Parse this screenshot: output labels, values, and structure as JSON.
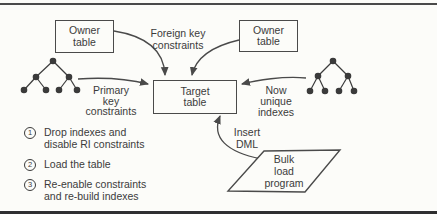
{
  "colors": {
    "background": "#fcfcf9",
    "line": "#4a4a4a",
    "text": "#3b3b3b"
  },
  "nodes": {
    "owner_table_left": {
      "lines": [
        "Owner",
        "table"
      ]
    },
    "owner_table_right": {
      "lines": [
        "Owner",
        "table"
      ]
    },
    "target_table": {
      "lines": [
        "Target",
        "table"
      ]
    },
    "bulk_load_program": {
      "lines": [
        "Bulk",
        "load",
        "program"
      ]
    }
  },
  "edge_labels": {
    "foreign_key": {
      "lines": [
        "Foreign key",
        "constraints"
      ]
    },
    "primary_key": {
      "lines": [
        "Primary",
        "key",
        "constraints"
      ]
    },
    "now_unique": {
      "lines": [
        "Now",
        "unique",
        "indexes"
      ]
    },
    "insert_dml": {
      "lines": [
        "Insert",
        "DML"
      ]
    }
  },
  "icons": {
    "index_tree_left": "btree-index-icon",
    "index_tree_right": "btree-index-icon"
  },
  "steps": [
    {
      "marker": "1",
      "lines": [
        "Drop indexes and",
        "disable RI constraints"
      ]
    },
    {
      "marker": "2",
      "lines": [
        "Load the table"
      ]
    },
    {
      "marker": "3",
      "lines": [
        "Re-enable constraints",
        "and re-build indexes"
      ]
    }
  ]
}
